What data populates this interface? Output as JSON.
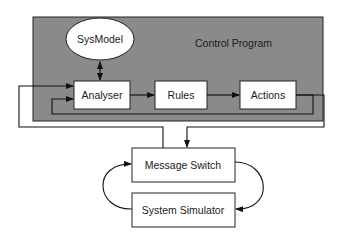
{
  "diagram": {
    "container": {
      "label": "Control Program",
      "fill": "#8a8a8a"
    },
    "nodes": {
      "sysmodel": {
        "label": "SysModel",
        "shape": "ellipse"
      },
      "analyser": {
        "label": "Analyser",
        "shape": "box"
      },
      "rules": {
        "label": "Rules",
        "shape": "box"
      },
      "actions": {
        "label": "Actions",
        "shape": "box"
      },
      "message_switch": {
        "label": "Message Switch",
        "shape": "box"
      },
      "system_simulator": {
        "label": "System Simulator",
        "shape": "box"
      }
    },
    "edges": [
      {
        "from": "SysModel",
        "to": "Analyser",
        "type": "bidirectional"
      },
      {
        "from": "Analyser",
        "to": "Rules"
      },
      {
        "from": "Rules",
        "to": "Actions"
      },
      {
        "from": "Actions",
        "to": "Analyser",
        "type": "feedback"
      },
      {
        "from": "Actions",
        "to": "Message Switch"
      },
      {
        "from": "Message Switch",
        "to": "Analyser"
      },
      {
        "from": "Message Switch",
        "to": "System Simulator"
      },
      {
        "from": "System Simulator",
        "to": "Message Switch"
      }
    ]
  }
}
